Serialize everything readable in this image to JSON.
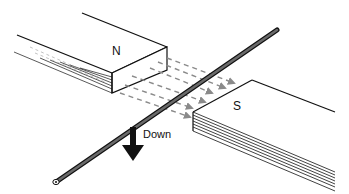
{
  "diagram": {
    "labels": {
      "north_pole": "N",
      "south_pole": "S",
      "motion_direction": "Down"
    },
    "colors": {
      "outline": "#111111",
      "field_lines": "#8a8a8a",
      "rod": "#555555",
      "background": "#ffffff"
    },
    "elements": {
      "magnets": [
        "N",
        "S"
      ],
      "wire": "conducting rod between poles",
      "field": "dashed arrows from N to S",
      "motion": "arrow pointing down"
    }
  }
}
